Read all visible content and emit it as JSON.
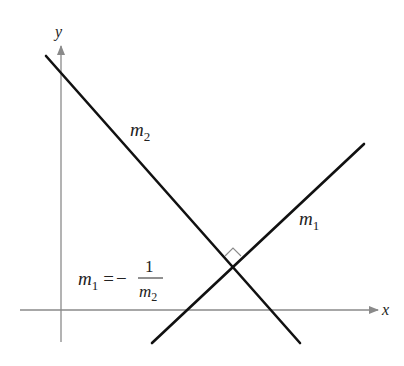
{
  "diagram": {
    "colors": {
      "axis": "#8a8a8a",
      "line": "#111111",
      "marker": "#8a8a8a",
      "text": "#222222"
    },
    "axes": {
      "x_label": "x",
      "y_label": "y",
      "origin": {
        "x": 61,
        "y": 310
      },
      "x_range": [
        20,
        378
      ],
      "y_range": [
        46,
        342
      ]
    },
    "lines": [
      {
        "name": "m1",
        "label_main": "m",
        "label_sub": "1",
        "from": [
          152,
          343
        ],
        "to": [
          364,
          144
        ]
      },
      {
        "name": "m2",
        "label_main": "m",
        "label_sub": "2",
        "from": [
          46,
          56
        ],
        "to": [
          300,
          343
        ]
      }
    ],
    "intersection": {
      "x": 233,
      "y": 265,
      "right_angle_marker": true
    },
    "formula": {
      "lhs_main": "m",
      "lhs_sub": "1",
      "equals": "=",
      "minus": "−",
      "numerator": "1",
      "den_main": "m",
      "den_sub": "2"
    }
  }
}
